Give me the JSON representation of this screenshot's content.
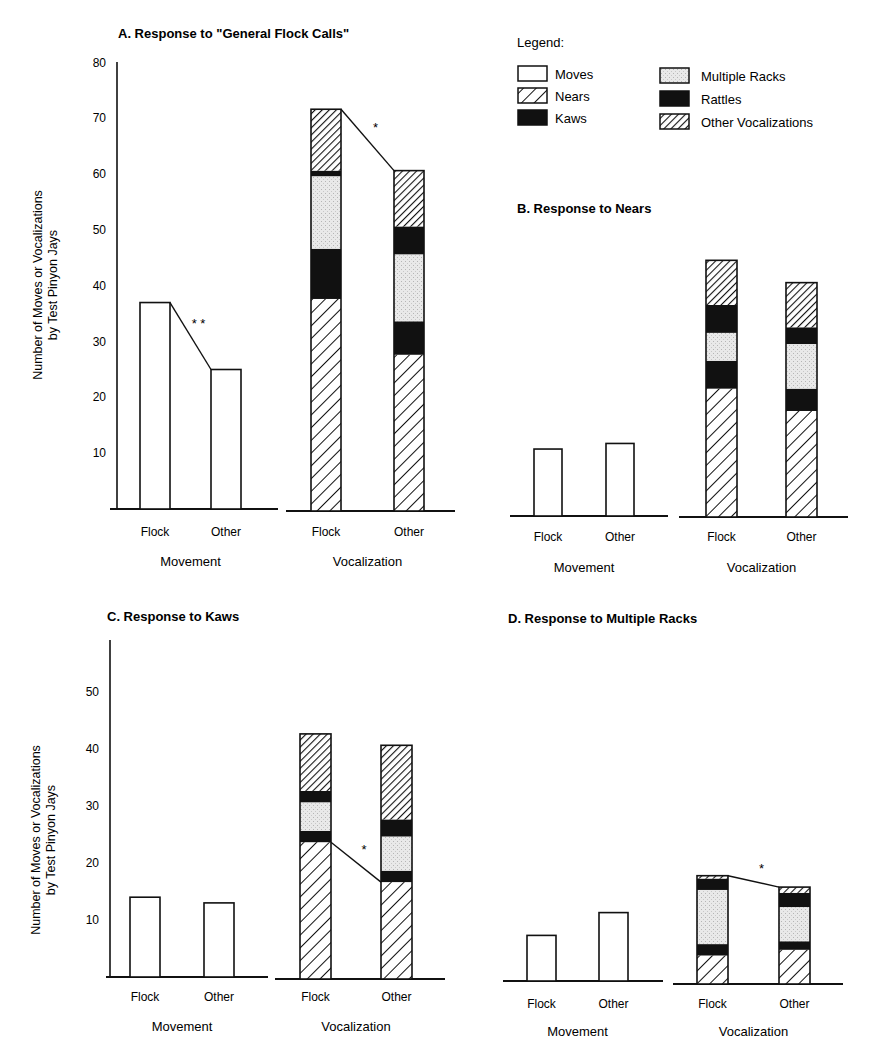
{
  "chart_data": [
    {
      "panel": "A",
      "type": "bar",
      "title": "A.   Response to \"General Flock Calls\"",
      "ylabel": "Number of Moves or Vocalizations\nby Test Pinyon Jays",
      "yticks": [
        10,
        20,
        30,
        40,
        50,
        60,
        70,
        80
      ],
      "ylim": [
        0,
        80
      ],
      "groups": [
        {
          "name": "Movement",
          "categories": [
            "Flock",
            "Other"
          ],
          "series": [
            {
              "name": "Moves",
              "values": [
                37,
                25
              ]
            }
          ],
          "significance": "* *",
          "connector": "top"
        },
        {
          "name": "Vocalization",
          "categories": [
            "Flock",
            "Other"
          ],
          "series": [
            {
              "name": "Nears",
              "values": [
                38,
                28
              ]
            },
            {
              "name": "Rattles",
              "values": [
                9,
                6
              ]
            },
            {
              "name": "Multiple Racks",
              "values": [
                13,
                12
              ]
            },
            {
              "name": "Rattles",
              "values": [
                1,
                5
              ]
            },
            {
              "name": "Other Vocalizations",
              "values": [
                11,
                10
              ]
            }
          ],
          "totals": [
            72,
            61
          ],
          "significance": "*",
          "connector": "top"
        }
      ]
    },
    {
      "panel": "B",
      "type": "bar",
      "title": "B.   Response to Nears",
      "ylim": [
        0,
        80
      ],
      "groups": [
        {
          "name": "Movement",
          "categories": [
            "Flock",
            "Other"
          ],
          "series": [
            {
              "name": "Moves",
              "values": [
                12,
                13
              ]
            }
          ]
        },
        {
          "name": "Vocalization",
          "categories": [
            "Flock",
            "Other"
          ],
          "series": [
            {
              "name": "Nears",
              "values": [
                23,
                19
              ]
            },
            {
              "name": "Rattles",
              "values": [
                5,
                4
              ]
            },
            {
              "name": "Multiple Racks",
              "values": [
                5,
                8
              ]
            },
            {
              "name": "Rattles",
              "values": [
                5,
                3
              ]
            },
            {
              "name": "Other Vocalizations",
              "values": [
                8,
                8
              ]
            }
          ],
          "totals": [
            46,
            42
          ]
        }
      ]
    },
    {
      "panel": "C",
      "type": "bar",
      "title": "C.   Response to Kaws",
      "ylabel": "Number of Moves or Vocalizations\nby Test Pinyon Jays",
      "yticks": [
        10,
        20,
        30,
        40,
        50
      ],
      "ylim": [
        0,
        60
      ],
      "groups": [
        {
          "name": "Movement",
          "categories": [
            "Flock",
            "Other"
          ],
          "series": [
            {
              "name": "Moves",
              "values": [
                14,
                13
              ]
            }
          ]
        },
        {
          "name": "Vocalization",
          "categories": [
            "Flock",
            "Other"
          ],
          "series": [
            {
              "name": "Nears",
              "values": [
                24,
                17
              ]
            },
            {
              "name": "Rattles",
              "values": [
                2,
                2
              ]
            },
            {
              "name": "Multiple Racks",
              "values": [
                5,
                6
              ]
            },
            {
              "name": "Rattles",
              "values": [
                2,
                3
              ]
            },
            {
              "name": "Other Vocalizations",
              "values": [
                10,
                13
              ]
            }
          ],
          "totals": [
            43,
            41
          ],
          "significance": "*",
          "connector": "nears"
        }
      ]
    },
    {
      "panel": "D",
      "type": "bar",
      "title": "D.   Response to Multiple Racks",
      "ylim": [
        0,
        60
      ],
      "groups": [
        {
          "name": "Movement",
          "categories": [
            "Flock",
            "Other"
          ],
          "series": [
            {
              "name": "Moves",
              "values": [
                8,
                12
              ]
            }
          ]
        },
        {
          "name": "Vocalization",
          "categories": [
            "Flock",
            "Other"
          ],
          "series": [
            {
              "name": "Nears",
              "values": [
                5,
                6
              ]
            },
            {
              "name": "Rattles",
              "values": [
                2,
                1.5
              ]
            },
            {
              "name": "Multiple Racks",
              "values": [
                9.5,
                6
              ]
            },
            {
              "name": "Rattles",
              "values": [
                2,
                2.5
              ]
            },
            {
              "name": "Other Vocalizations",
              "values": [
                0.5,
                1
              ]
            }
          ],
          "totals": [
            19,
            17
          ],
          "significance": "*",
          "connector": "top"
        }
      ]
    }
  ],
  "legend": {
    "title": "Legend:",
    "items": [
      {
        "label": "Moves",
        "pattern": "moves"
      },
      {
        "label": "Nears",
        "pattern": "nears"
      },
      {
        "label": "Kaws",
        "pattern": "kaws"
      },
      {
        "label": "Multiple Racks",
        "pattern": "racks"
      },
      {
        "label": "Rattles",
        "pattern": "rattles"
      },
      {
        "label": "Other Vocalizations",
        "pattern": "other"
      }
    ]
  },
  "labels": {
    "movement": "Movement",
    "vocalization": "Vocalization",
    "flock": "Flock",
    "other": "Other",
    "ylabel_line1": "Number of Moves or Vocalizations",
    "ylabel_line2": "by Test Pinyon Jays"
  }
}
